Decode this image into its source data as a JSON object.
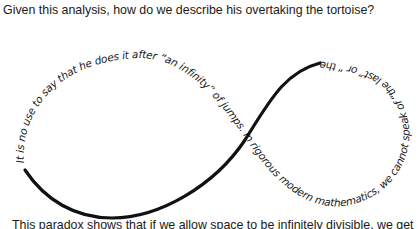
{
  "captions": {
    "top": "Given this analysis, how do we describe his overtaking the tortoise?",
    "bottom": "This paradox shows that if we allow space to be infinitely divisible, we get"
  },
  "figure": {
    "curve_color": "#111111",
    "curved_text": "It is no use to say that he does it after “an infinity” of jumps. In rigorous modern mathematics, we cannot speak of “the last” or “ the infinitieth” term of a series."
  }
}
